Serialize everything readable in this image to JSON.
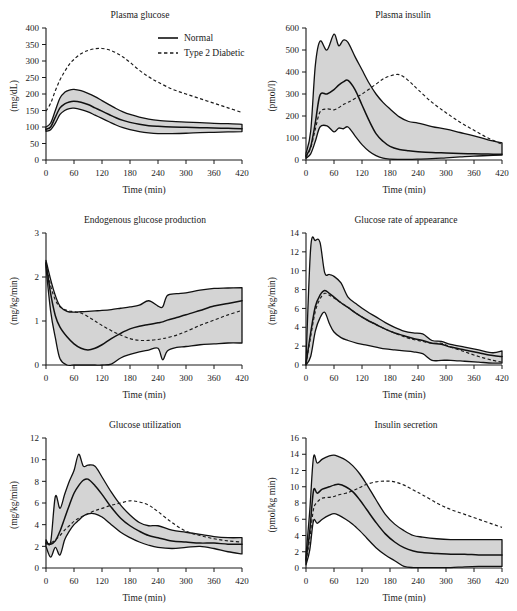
{
  "figure": {
    "legend": {
      "normal_label": "Normal",
      "diabetic_label": "Type 2 Diabetic"
    },
    "xlabel": "Time (min)",
    "band_color": "#d4d4d4",
    "line_color": "#111111"
  },
  "chart_data": [
    {
      "type": "line",
      "title": "Plasma glucose",
      "xlabel": "Time (min)",
      "ylabel": "(mg/dL)",
      "xlim": [
        0,
        420
      ],
      "ylim": [
        0,
        400
      ],
      "xticks": [
        0,
        60,
        120,
        180,
        240,
        300,
        360,
        420
      ],
      "yticks": [
        0,
        50,
        100,
        150,
        200,
        250,
        300,
        350,
        400
      ],
      "grid": false,
      "legend_position": "top-right",
      "x": [
        0,
        10,
        20,
        30,
        40,
        50,
        60,
        75,
        90,
        105,
        120,
        135,
        150,
        165,
        180,
        200,
        220,
        240,
        270,
        300,
        330,
        360,
        390,
        420
      ],
      "series": [
        {
          "name": "Normal mean",
          "style": "solid",
          "values": [
            93,
            100,
            130,
            158,
            170,
            176,
            178,
            175,
            168,
            158,
            148,
            138,
            128,
            120,
            114,
            108,
            104,
            102,
            100,
            99,
            98,
            97,
            96,
            95
          ]
        },
        {
          "name": "Normal upper band",
          "style": "band-edge",
          "values": [
            100,
            112,
            150,
            188,
            205,
            212,
            214,
            210,
            202,
            192,
            180,
            168,
            156,
            146,
            138,
            130,
            124,
            120,
            117,
            115,
            113,
            111,
            110,
            108
          ]
        },
        {
          "name": "Normal lower band",
          "style": "band-edge",
          "values": [
            87,
            92,
            112,
            138,
            150,
            156,
            157,
            153,
            146,
            136,
            126,
            116,
            106,
            98,
            92,
            86,
            82,
            80,
            80,
            81,
            83,
            84,
            85,
            86
          ]
        },
        {
          "name": "Type 2 Diabetic",
          "style": "dashed",
          "values": [
            148,
            172,
            210,
            243,
            268,
            290,
            305,
            322,
            332,
            337,
            338,
            334,
            325,
            312,
            296,
            272,
            252,
            236,
            215,
            200,
            186,
            172,
            158,
            144
          ]
        }
      ]
    },
    {
      "type": "line",
      "title": "Plasma insulin",
      "xlabel": "Time (min)",
      "ylabel": "(pmol/l)",
      "xlim": [
        0,
        420
      ],
      "ylim": [
        0,
        600
      ],
      "xticks": [
        0,
        60,
        120,
        180,
        240,
        300,
        360,
        420
      ],
      "yticks": [
        0,
        100,
        200,
        300,
        400,
        500,
        600
      ],
      "grid": false,
      "x": [
        0,
        10,
        20,
        30,
        45,
        60,
        70,
        80,
        90,
        105,
        120,
        135,
        150,
        165,
        180,
        200,
        220,
        240,
        270,
        300,
        330,
        360,
        390,
        420
      ],
      "series": [
        {
          "name": "Normal mean",
          "style": "solid",
          "values": [
            18,
            60,
            170,
            295,
            300,
            320,
            340,
            355,
            362,
            320,
            250,
            180,
            120,
            85,
            62,
            48,
            42,
            38,
            34,
            32,
            30,
            28,
            27,
            26
          ]
        },
        {
          "name": "Normal upper band",
          "style": "band-edge",
          "values": [
            30,
            130,
            430,
            540,
            500,
            572,
            520,
            545,
            535,
            470,
            410,
            350,
            300,
            262,
            232,
            196,
            175,
            168,
            152,
            140,
            125,
            110,
            92,
            78
          ]
        },
        {
          "name": "Normal lower band",
          "style": "band-edge",
          "values": [
            8,
            28,
            85,
            150,
            155,
            128,
            145,
            142,
            150,
            110,
            70,
            40,
            20,
            8,
            4,
            3,
            3,
            4,
            6,
            10,
            14,
            18,
            20,
            22
          ]
        },
        {
          "name": "Type 2 Diabetic",
          "style": "dashed",
          "values": [
            14,
            55,
            140,
            218,
            232,
            228,
            238,
            252,
            262,
            280,
            300,
            322,
            345,
            368,
            382,
            388,
            360,
            320,
            262,
            215,
            172,
            135,
            100,
            72
          ]
        }
      ]
    },
    {
      "type": "line",
      "title": "Endogenous glucose production",
      "xlabel": "Time (min)",
      "ylabel": "(mg/kg/min)",
      "xlim": [
        0,
        420
      ],
      "ylim": [
        0,
        3
      ],
      "xticks": [
        0,
        60,
        120,
        180,
        240,
        300,
        360,
        420
      ],
      "yticks": [
        0,
        1,
        2,
        3
      ],
      "grid": false,
      "x": [
        0,
        10,
        20,
        30,
        45,
        60,
        75,
        90,
        105,
        120,
        140,
        160,
        180,
        200,
        220,
        240,
        250,
        260,
        280,
        300,
        330,
        360,
        390,
        420
      ],
      "series": [
        {
          "name": "Normal mean",
          "style": "solid",
          "values": [
            2.32,
            1.62,
            1.12,
            0.86,
            0.64,
            0.48,
            0.38,
            0.34,
            0.38,
            0.46,
            0.6,
            0.72,
            0.82,
            0.88,
            0.92,
            0.96,
            0.98,
            1.02,
            1.08,
            1.14,
            1.24,
            1.34,
            1.4,
            1.46
          ]
        },
        {
          "name": "Normal upper band",
          "style": "band-edge",
          "values": [
            2.38,
            1.94,
            1.58,
            1.34,
            1.22,
            1.2,
            1.21,
            1.22,
            1.23,
            1.24,
            1.26,
            1.29,
            1.32,
            1.36,
            1.46,
            1.34,
            1.32,
            1.58,
            1.62,
            1.64,
            1.7,
            1.74,
            1.75,
            1.76
          ]
        },
        {
          "name": "Normal lower band",
          "style": "band-edge",
          "values": [
            2.22,
            1.22,
            0.62,
            0.14,
            0.0,
            0.0,
            0.0,
            0.0,
            0.0,
            0.0,
            0.02,
            0.16,
            0.24,
            0.3,
            0.34,
            0.38,
            0.12,
            0.32,
            0.4,
            0.42,
            0.46,
            0.48,
            0.5,
            0.5
          ]
        },
        {
          "name": "Type 2 Diabetic",
          "style": "dashed",
          "values": [
            2.3,
            1.8,
            1.48,
            1.32,
            1.24,
            1.21,
            1.18,
            1.1,
            1.0,
            0.9,
            0.78,
            0.68,
            0.6,
            0.56,
            0.56,
            0.58,
            0.6,
            0.62,
            0.68,
            0.76,
            0.9,
            1.02,
            1.14,
            1.24
          ]
        }
      ]
    },
    {
      "type": "line",
      "title": "Glucose rate of appearance",
      "xlabel": "Time (min)",
      "ylabel": "(mg/kg/min)",
      "xlim": [
        0,
        420
      ],
      "ylim": [
        0,
        14
      ],
      "xticks": [
        0,
        60,
        120,
        180,
        240,
        300,
        360,
        420
      ],
      "yticks": [
        0,
        2,
        4,
        6,
        8,
        10,
        12,
        14
      ],
      "grid": false,
      "x": [
        0,
        10,
        20,
        30,
        40,
        50,
        60,
        75,
        90,
        110,
        130,
        150,
        170,
        190,
        210,
        230,
        250,
        270,
        290,
        310,
        340,
        370,
        400,
        420
      ],
      "series": [
        {
          "name": "Normal mean",
          "style": "solid",
          "values": [
            0.1,
            3.4,
            6.2,
            7.4,
            7.9,
            7.6,
            7.2,
            6.6,
            6.1,
            5.4,
            4.8,
            4.3,
            3.8,
            3.4,
            3.1,
            2.8,
            2.6,
            2.3,
            2.2,
            1.9,
            1.6,
            1.3,
            1.0,
            0.9
          ]
        },
        {
          "name": "Normal upper band",
          "style": "band-edge",
          "values": [
            0.4,
            12.4,
            13.2,
            13.0,
            9.8,
            9.6,
            9.4,
            8.7,
            7.2,
            6.4,
            5.7,
            5.1,
            4.5,
            4.0,
            3.6,
            3.4,
            3.3,
            2.6,
            2.5,
            2.2,
            1.9,
            1.6,
            1.3,
            1.5
          ]
        },
        {
          "name": "Normal lower band",
          "style": "band-edge",
          "values": [
            0.0,
            0.9,
            3.6,
            5.0,
            5.6,
            4.4,
            3.5,
            2.9,
            2.6,
            2.3,
            2.1,
            1.9,
            1.7,
            1.6,
            1.5,
            1.4,
            1.2,
            0.5,
            0.5,
            0.5,
            0.4,
            0.3,
            0.2,
            0.2
          ]
        },
        {
          "name": "Type 2 Diabetic",
          "style": "dashed",
          "values": [
            0.1,
            3.0,
            5.7,
            7.0,
            7.6,
            7.4,
            7.1,
            6.6,
            6.1,
            5.4,
            4.8,
            4.3,
            3.8,
            3.4,
            3.0,
            2.7,
            2.5,
            2.3,
            2.3,
            1.9,
            1.4,
            0.9,
            0.5,
            0.3
          ]
        }
      ]
    },
    {
      "type": "line",
      "title": "Glucose utilization",
      "xlabel": "Time (min)",
      "ylabel": "(mg/kg/min)",
      "xlim": [
        0,
        420
      ],
      "ylim": [
        0,
        12
      ],
      "xticks": [
        0,
        60,
        120,
        180,
        240,
        300,
        360,
        420
      ],
      "yticks": [
        0,
        2,
        4,
        6,
        8,
        10,
        12
      ],
      "grid": false,
      "x": [
        0,
        10,
        20,
        30,
        40,
        50,
        60,
        70,
        80,
        90,
        105,
        120,
        140,
        160,
        180,
        200,
        220,
        240,
        270,
        300,
        330,
        360,
        390,
        420
      ],
      "series": [
        {
          "name": "Normal mean",
          "style": "solid",
          "values": [
            2.3,
            2.2,
            2.5,
            3.4,
            4.6,
            5.8,
            6.9,
            7.6,
            8.1,
            8.2,
            7.6,
            6.8,
            5.6,
            4.6,
            3.9,
            3.4,
            3.0,
            2.8,
            2.5,
            2.4,
            2.3,
            2.3,
            2.2,
            2.2
          ]
        },
        {
          "name": "Normal upper band",
          "style": "band-edge",
          "values": [
            2.6,
            2.4,
            6.6,
            5.5,
            6.8,
            8.0,
            9.0,
            10.5,
            9.4,
            9.5,
            9.4,
            8.4,
            7.0,
            5.8,
            4.9,
            4.2,
            3.9,
            3.9,
            3.5,
            3.3,
            3.1,
            2.9,
            2.8,
            2.8
          ]
        },
        {
          "name": "Normal lower band",
          "style": "band-edge",
          "values": [
            2.0,
            1.0,
            1.9,
            1.2,
            2.6,
            3.4,
            4.0,
            4.4,
            4.8,
            5.0,
            5.0,
            4.7,
            4.0,
            3.3,
            2.8,
            2.4,
            2.1,
            1.9,
            1.8,
            1.9,
            2.0,
            1.8,
            1.5,
            1.3
          ]
        },
        {
          "name": "Type 2 Diabetic",
          "style": "dashed",
          "values": [
            2.2,
            2.3,
            2.6,
            3.0,
            3.5,
            3.9,
            4.3,
            4.6,
            4.8,
            5.0,
            5.3,
            5.5,
            5.8,
            6.0,
            6.2,
            6.1,
            5.8,
            5.2,
            4.2,
            3.4,
            3.0,
            2.7,
            2.5,
            2.4
          ]
        }
      ]
    },
    {
      "type": "line",
      "title": "Insulin secretion",
      "xlabel": "Time (min)",
      "ylabel": "(pmol/kg min)",
      "xlim": [
        0,
        420
      ],
      "ylim": [
        0,
        16
      ],
      "xticks": [
        0,
        60,
        120,
        180,
        240,
        300,
        360,
        420
      ],
      "yticks": [
        0,
        2,
        4,
        6,
        8,
        10,
        12,
        14,
        16
      ],
      "grid": false,
      "x": [
        0,
        8,
        16,
        24,
        35,
        50,
        60,
        70,
        85,
        100,
        115,
        130,
        150,
        170,
        190,
        210,
        230,
        250,
        280,
        310,
        340,
        370,
        400,
        420
      ],
      "series": [
        {
          "name": "Normal mean",
          "style": "solid",
          "values": [
            1.0,
            4.5,
            9.5,
            9.2,
            9.7,
            10.0,
            10.2,
            10.3,
            10.0,
            9.4,
            8.4,
            7.2,
            5.6,
            4.2,
            3.2,
            2.5,
            2.1,
            1.9,
            1.8,
            1.7,
            1.7,
            1.6,
            1.6,
            1.6
          ]
        },
        {
          "name": "Normal upper band",
          "style": "band-edge",
          "values": [
            1.6,
            7.0,
            13.6,
            12.9,
            13.4,
            13.8,
            13.9,
            13.7,
            13.3,
            12.6,
            11.6,
            10.3,
            8.4,
            6.6,
            5.4,
            4.6,
            4.0,
            3.8,
            3.6,
            3.5,
            3.5,
            3.5,
            3.5,
            3.5
          ]
        },
        {
          "name": "Normal lower band",
          "style": "band-edge",
          "values": [
            0.4,
            2.2,
            5.8,
            5.5,
            6.0,
            6.5,
            6.7,
            6.5,
            6.0,
            5.4,
            4.6,
            3.7,
            2.5,
            1.6,
            0.9,
            0.2,
            0.05,
            0.05,
            0.05,
            0.05,
            0.15,
            0.2,
            0.2,
            0.2
          ]
        },
        {
          "name": "Type 2 Diabetic",
          "style": "dashed",
          "values": [
            0.8,
            3.6,
            7.2,
            8.1,
            8.6,
            8.7,
            8.8,
            9.0,
            9.2,
            9.5,
            9.9,
            10.3,
            10.6,
            10.7,
            10.6,
            10.2,
            9.6,
            9.0,
            8.0,
            7.2,
            6.6,
            6.0,
            5.4,
            5.0
          ]
        }
      ]
    }
  ]
}
